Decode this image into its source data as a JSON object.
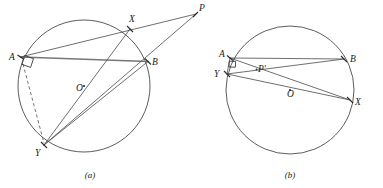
{
  "figure": {
    "background_color": "#ffffff",
    "stroke_color": "#4a4a4a",
    "label_color": "#1a1a1a",
    "highlight_color": "#777777"
  },
  "panel_a": {
    "caption": "(a)",
    "caption_x": 90,
    "caption_y": 178,
    "circle": {
      "cx": 84,
      "cy": 86,
      "r": 66
    },
    "points": {
      "A": {
        "label": "A",
        "x": 20.5,
        "y": 57,
        "lx": 9,
        "ly": 60
      },
      "B": {
        "label": "B",
        "x": 148,
        "y": 61.5,
        "lx": 152,
        "ly": 65
      },
      "X": {
        "label": "X",
        "x": 130,
        "y": 29,
        "lx": 129,
        "ly": 22
      },
      "Y": {
        "label": "Y",
        "x": 44,
        "y": 145,
        "lx": 35,
        "ly": 156
      },
      "O": {
        "label": "O",
        "x": 84,
        "y": 86,
        "lx": 76,
        "ly": 91
      },
      "P": {
        "label": "P",
        "x": 196,
        "y": 14,
        "lx": 199,
        "ly": 11
      }
    },
    "segments": [
      {
        "name": "chord-AB",
        "from": "A",
        "to": "B",
        "style": "thick"
      },
      {
        "name": "line-A-to-P",
        "from": "A",
        "to": "P",
        "style": "plain"
      },
      {
        "name": "line-Y-to-P",
        "from": "Y",
        "to": "P",
        "style": "plain"
      },
      {
        "name": "chord-X-Y",
        "from": "X",
        "to": "Y",
        "style": "plain"
      },
      {
        "name": "chord-B-Y",
        "from": "B",
        "to": "Y",
        "style": "plain"
      },
      {
        "name": "segment-A-Y-dashed",
        "from": "A",
        "to": "Y",
        "style": "dashed"
      }
    ],
    "right_angle_at": "A"
  },
  "panel_b": {
    "caption": "(b)",
    "caption_x": 290,
    "caption_y": 178,
    "circle": {
      "cx": 290,
      "cy": 90,
      "r": 64
    },
    "points": {
      "A": {
        "label": "A",
        "x": 230,
        "y": 58,
        "lx": 219,
        "ly": 57
      },
      "B": {
        "label": "B",
        "x": 344,
        "y": 59,
        "lx": 350,
        "ly": 62
      },
      "Y": {
        "label": "Y",
        "x": 227,
        "y": 74,
        "lx": 214,
        "ly": 77
      },
      "X": {
        "label": "X",
        "x": 350,
        "y": 100,
        "lx": 355,
        "ly": 105
      },
      "O": {
        "label": "O",
        "x": 290,
        "y": 90,
        "lx": 287,
        "ly": 97
      },
      "Pprime": {
        "label": "P'",
        "x": 259,
        "y": 73,
        "lx": 258,
        "ly": 72
      }
    },
    "segments": [
      {
        "name": "chord-AB",
        "from": "A",
        "to": "B",
        "style": "plain"
      },
      {
        "name": "chord-A-X",
        "from": "A",
        "to": "X",
        "style": "plain"
      },
      {
        "name": "chord-Y-B",
        "from": "Y",
        "to": "B",
        "style": "plain"
      },
      {
        "name": "chord-Y-X",
        "from": "Y",
        "to": "X",
        "style": "plain"
      },
      {
        "name": "segment-A-Y",
        "from": "A",
        "to": "Y",
        "style": "plain"
      }
    ],
    "right_angle_at": "A"
  }
}
